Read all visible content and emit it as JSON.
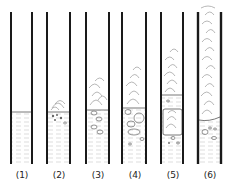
{
  "diagram": {
    "type": "test-tube sequence",
    "tubes": [
      {
        "label": "(1)",
        "x": 11,
        "liquid_top": 112,
        "foam": "none",
        "particles": "none"
      },
      {
        "label": "(2)",
        "x": 47,
        "liquid_top": 112,
        "foam": "small",
        "particles": "small bubbles"
      },
      {
        "label": "(3)",
        "x": 86,
        "liquid_top": 110,
        "foam": "medium",
        "particles": "bubbles"
      },
      {
        "label": "(4)",
        "x": 122,
        "liquid_top": 108,
        "foam": "large",
        "particles": "large bubbles"
      },
      {
        "label": "(5)",
        "x": 161,
        "liquid_top": 95,
        "foam": "large with plug",
        "particles": "few bubbles"
      },
      {
        "label": "(6)",
        "x": 198,
        "liquid_top": 120,
        "foam": "full column",
        "particles": "few bubbles"
      }
    ],
    "colors": {
      "line": "#1a1a1a",
      "sketch": "#9a9a9a"
    }
  }
}
